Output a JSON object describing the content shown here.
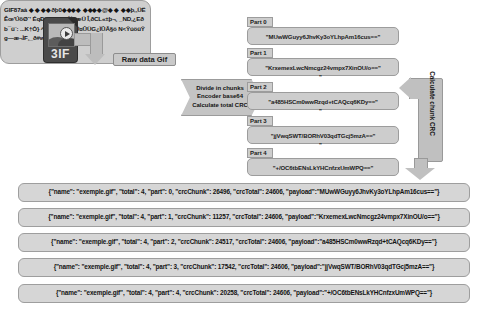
{
  "diagram": {
    "source_icon": {
      "name": "gif-file-icon",
      "extension_label": "3IF"
    },
    "raw_data_label": "Raw data Gif",
    "raw_data_blob": "GIF87aà ◆  ◆ ◆◆ðþ0◆◆◆◆ ◆◆◆◆@◆ ◆ ◆◆þ,,ÜËÊœ'ÚõØ´' ÉqÐê,, ‰«\"†¾¢æÜ Î,ðCL«±þ¬¸  _ND,¿Eðb¯ü¨: ...K†Ò} ^‰«{*rzÈ^ÄÛ¤ÛÜG¿ÏÛÃ§ö N<ŶúöüŶ g—æ¬ÌF¸_ð#w×ghææ..¸",
    "divide_step": {
      "line1": "Divide in chunks",
      "line2": "Encoder base64",
      "line3": "Calculate total CRC"
    },
    "crc_step": {
      "label": "Calculate chunk CRC"
    },
    "parts": [
      {
        "tag": "Part 0",
        "payload_display": "\"MUwWGuyy6JhvKy3oYLhpAm16cus==\"",
        "trailing_quote": ""
      },
      {
        "tag": "Part 1",
        "payload_display": "\"KrxemexLwcNmcgz24vmpx7XinOU/o==\"",
        "trailing_quote": "\""
      },
      {
        "tag": "Part 2",
        "payload_display": "\"a485HSCm0wwRzqd+tCAQcq6KDy==\"",
        "trailing_quote": "\""
      },
      {
        "tag": "Part 3",
        "payload_display": "\"jjVwqSWT/BORhV03qdTGcj5mzA==\"",
        "trailing_quote": "\""
      },
      {
        "tag": "Part 4",
        "payload_display": "\"+/OC6tbENsLkYHCnfzxUmWPQ==\"",
        "trailing_quote": ""
      }
    ],
    "json_messages": [
      "{\"name\": \"exemple.gif\", \"total\": 4, \"part\": 0, \"crcChunk\": 26496, \"crcTotal\": 24606, \"payload\":\"MUwWGuyy6JhvKy3oYLhpAm16cus==\"}",
      "{\"name\": \"exemple.gif\", \"total\": 4, \"part\": 1, \"crcChunk\": 11257, \"crcTotal\": 24606, \"payload\":\"KrxemexLwcNmcgz24vmpx7XinOU/o==\"}",
      "{\"name\": \"exemple.gif\", \"total\": 4, \"part\": 2, \"crcChunk\": 24517, \"crcTotal\": 24606, \"payload\":\"a485HSCm0wwRzqd+tCAQcq6KDy==\"}",
      "{\"name\": \"exemple.gif\", \"total\": 4, \"part\": 3, \"crcChunk\": 17542, \"crcTotal\": 24606, \"payload\":\"jjVwqSWT/BORhV03qdTGcj5mzA==\"}",
      "{\"name\": \"exemple.gif\", \"total\": 4, \"part\": 4, \"crcChunk\": 20258, \"crcTotal\": 24606, \"payload\":\"+/OC6tbENsLkYHCnfzxUmWPQ==\"}"
    ],
    "colors": {
      "box_fill": "#d3d3d3",
      "box_border": "#8d8d8d",
      "arrow_fill": "#c0c0c0",
      "icon_dark": "#4a4a4a",
      "text": "#141414",
      "background": "#ffffff"
    }
  }
}
